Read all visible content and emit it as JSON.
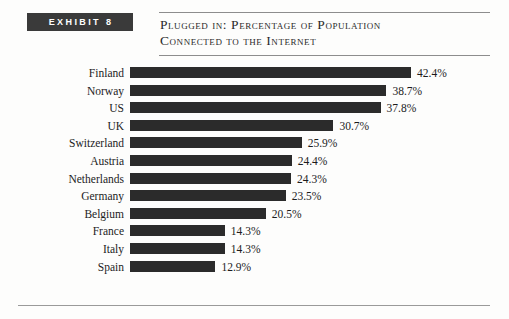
{
  "exhibit": {
    "badge_label": "EXHIBIT 8",
    "title": "Plugged in: Percentage of Population\nConnected to the Internet"
  },
  "colors": {
    "bar": "#2b2b2b",
    "badge_background": "#3a3a3a",
    "badge_text": "#ffffff",
    "rule": "#8d8d8d",
    "page_background": "#fdfdfc",
    "text": "#1c1c1c"
  },
  "chart_data": {
    "type": "bar",
    "orientation": "horizontal",
    "title": "Plugged in: Percentage of Population Connected to the Internet",
    "xlabel": "",
    "ylabel": "",
    "xlim": [
      0,
      42.4
    ],
    "grid": false,
    "legend": null,
    "categories": [
      "Finland",
      "Norway",
      "US",
      "UK",
      "Switzerland",
      "Austria",
      "Netherlands",
      "Germany",
      "Belgium",
      "France",
      "Italy",
      "Spain"
    ],
    "values": [
      42.4,
      38.7,
      37.8,
      30.7,
      25.9,
      24.4,
      24.3,
      23.5,
      20.5,
      14.3,
      14.3,
      12.9
    ],
    "value_labels": [
      "42.4%",
      "38.7%",
      "37.8%",
      "30.7%",
      "25.9%",
      "24.4%",
      "24.3%",
      "23.5%",
      "20.5%",
      "14.3%",
      "14.3%",
      "12.9%"
    ]
  }
}
